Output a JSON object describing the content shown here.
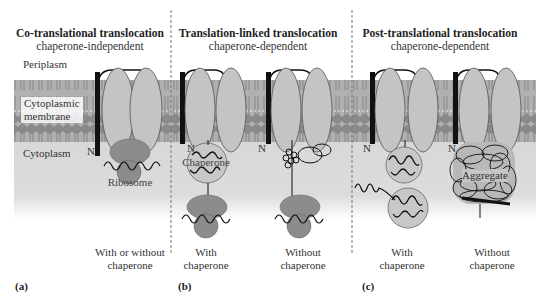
{
  "figure": {
    "regions": {
      "periplasm": "Periplasm",
      "membrane_line1": "Cytoplasmic",
      "membrane_line2": "membrane",
      "cytoplasm": "Cytoplasm"
    },
    "panels": [
      {
        "id": "a",
        "label": "(a)",
        "title": "Co-translational translocation",
        "subtitle": "chaperone-independent",
        "n_terminus": "N",
        "structures": [
          "Ribosome"
        ],
        "captions": [
          {
            "line1": "With or without",
            "line2": "chaperone"
          }
        ]
      },
      {
        "id": "b",
        "label": "(b)",
        "title": "Translation-linked translocation",
        "subtitle": "chaperone-dependent",
        "n_terminus": "N",
        "structures": [
          "Chaperone"
        ],
        "captions": [
          {
            "line1": "With",
            "line2": "chaperone"
          },
          {
            "line1": "Without",
            "line2": "chaperone"
          }
        ]
      },
      {
        "id": "c",
        "label": "(c)",
        "title": "Post-translational translocation",
        "subtitle": "chaperone-dependent",
        "n_terminus": "N",
        "structures": [
          "Aggregate"
        ],
        "captions": [
          {
            "line1": "With",
            "line2": "chaperone"
          },
          {
            "line1": "Without",
            "line2": "chaperone"
          }
        ]
      }
    ],
    "colors": {
      "cytoplasm": "#d9d9d9",
      "membrane_heads": "#8a8a8a",
      "membrane_tails": "#a3a3a3",
      "channel": "#c4c4c4",
      "ribosome": "#8c8c8c",
      "chaperone": "#c8c8c8",
      "divider": "#777777"
    }
  }
}
